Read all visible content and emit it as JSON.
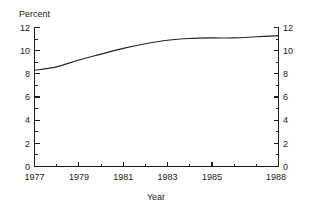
{
  "chart_data": {
    "type": "line",
    "title": "",
    "xlabel": "Year",
    "ylabel": "Percent",
    "y_axis_label_position": "top-left",
    "grid": false,
    "legend": false,
    "dual_y_axis": true,
    "xlim": [
      1977,
      1988
    ],
    "ylim": [
      0,
      12
    ],
    "x_major_ticks": [
      1977,
      1979,
      1981,
      1983,
      1985,
      1988
    ],
    "x_minor_ticks": [
      1978,
      1980,
      1982,
      1984,
      1986,
      1987
    ],
    "x_tick_labels": [
      "1977",
      "1979",
      "1981",
      "1983",
      "1985",
      "1988"
    ],
    "y_major_ticks": [
      0,
      2,
      4,
      6,
      8,
      10,
      12
    ],
    "y_minor_ticks": [
      1,
      3,
      5,
      7,
      9,
      11
    ],
    "y_tick_labels_left": [
      "0",
      "2",
      "4",
      "6",
      "8",
      "10",
      "12"
    ],
    "y_tick_labels_right": [
      "0",
      "2",
      "4",
      "6",
      "8",
      "10",
      "12"
    ],
    "x": [
      1977,
      1978,
      1979,
      1980,
      1981,
      1982,
      1983,
      1984,
      1985,
      1986,
      1987,
      1988
    ],
    "values": [
      8.3,
      8.6,
      9.2,
      9.7,
      10.2,
      10.6,
      10.9,
      11.05,
      11.1,
      11.1,
      11.2,
      11.3
    ],
    "series": [
      {
        "name": "Percent",
        "color": "#232323",
        "values": [
          8.3,
          8.6,
          9.2,
          9.7,
          10.2,
          10.6,
          10.9,
          11.05,
          11.1,
          11.1,
          11.2,
          11.3
        ]
      }
    ]
  },
  "labels": {
    "y_axis_title": "Percent",
    "x_axis_title": "Year"
  },
  "colors": {
    "line": "#232323",
    "axis": "#1d1d1d",
    "background": "#ffffff",
    "text": "#1a1a1a"
  }
}
